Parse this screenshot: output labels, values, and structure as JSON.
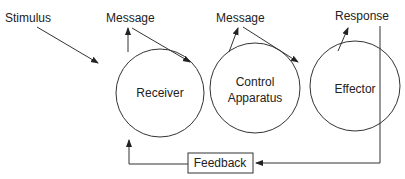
{
  "diagram": {
    "labels": {
      "stimulus": "Stimulus",
      "message1": "Message",
      "message2": "Message",
      "response": "Response"
    },
    "nodes": {
      "receiver": "Receiver",
      "control_line1": "Control",
      "control_line2": "Apparatus",
      "effector": "Effector",
      "feedback": "Feedback"
    },
    "colors": {
      "stroke": "#333333",
      "text": "#222222",
      "background": "#ffffff"
    }
  }
}
